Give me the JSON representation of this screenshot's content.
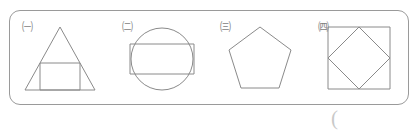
{
  "worksheet": {
    "container_name": "figure-box",
    "border_color": "#9a9a9a",
    "stroke_color": "#8a8a8a",
    "background_color": "#ffffff",
    "answer_paren": "("
  },
  "figures": [
    {
      "label": "㈠",
      "label_plain": "(1)",
      "shape": "triangle-with-inscribed-square",
      "description": "Isosceles triangle containing an inscribed square resting on the base"
    },
    {
      "label": "㈡",
      "label_plain": "(2)",
      "shape": "circle-with-inscribed-rectangle",
      "description": "Circle containing a horizontal rectangle spanning its width"
    },
    {
      "label": "㈢",
      "label_plain": "(3)",
      "shape": "pentagon",
      "description": "Regular pentagon with a vertex pointing up"
    },
    {
      "label": "㈣",
      "label_plain": "(4)",
      "shape": "square-with-inscribed-diamond",
      "description": "Square containing a diamond whose vertices touch the side midpoints"
    }
  ]
}
